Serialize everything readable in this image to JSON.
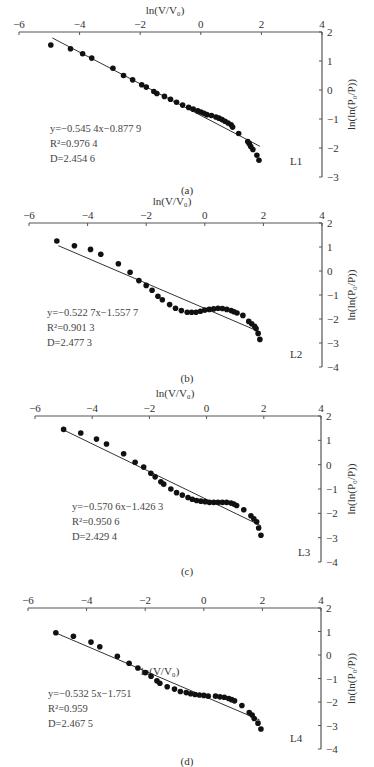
{
  "chart_data": [
    {
      "type": "scatter",
      "panel": "(a)",
      "series_label": "L1",
      "xlabel": "ln(V/V0)",
      "ylabel": "ln(ln(P0/P))",
      "xlim": [
        -6,
        4
      ],
      "ylim": [
        -3,
        2
      ],
      "xticks": [
        -6,
        -4,
        -2,
        0,
        2,
        4
      ],
      "yticks": [
        2,
        1,
        0,
        -1,
        -2,
        -3
      ],
      "fit": {
        "slope": -0.5454,
        "intercept": -0.8779,
        "x_range": [
          -4.9,
          1.95
        ]
      },
      "annotations": [
        "y=−0.545 4x−0.877 9",
        "R²=0.976 4",
        "D=2.454 6"
      ],
      "points": [
        [
          -4.95,
          1.55
        ],
        [
          -4.3,
          1.42
        ],
        [
          -3.9,
          1.25
        ],
        [
          -3.6,
          1.1
        ],
        [
          -2.9,
          0.75
        ],
        [
          -2.55,
          0.5
        ],
        [
          -2.25,
          0.35
        ],
        [
          -1.95,
          0.18
        ],
        [
          -1.8,
          0.1
        ],
        [
          -1.55,
          -0.05
        ],
        [
          -1.45,
          -0.12
        ],
        [
          -1.2,
          -0.22
        ],
        [
          -1.0,
          -0.32
        ],
        [
          -0.8,
          -0.42
        ],
        [
          -0.6,
          -0.52
        ],
        [
          -0.4,
          -0.6
        ],
        [
          -0.25,
          -0.66
        ],
        [
          -0.1,
          -0.72
        ],
        [
          0.0,
          -0.76
        ],
        [
          0.1,
          -0.8
        ],
        [
          0.2,
          -0.85
        ],
        [
          0.35,
          -0.88
        ],
        [
          0.5,
          -0.93
        ],
        [
          0.6,
          -0.97
        ],
        [
          0.7,
          -1.02
        ],
        [
          0.8,
          -1.08
        ],
        [
          0.9,
          -1.14
        ],
        [
          1.0,
          -1.2
        ],
        [
          1.05,
          -1.28
        ],
        [
          1.25,
          -1.5
        ],
        [
          1.55,
          -1.78
        ],
        [
          1.6,
          -1.85
        ],
        [
          1.65,
          -1.95
        ],
        [
          1.72,
          -2.05
        ],
        [
          1.85,
          -2.25
        ],
        [
          1.92,
          -2.42
        ]
      ]
    },
    {
      "type": "scatter",
      "panel": "(b)",
      "series_label": "L2",
      "xlabel": "ln(V/V0)",
      "ylabel": "ln(ln(P0/P))",
      "xlim": [
        -6,
        4
      ],
      "ylim": [
        -4,
        2
      ],
      "xticks": [
        -6,
        -4,
        -2,
        0,
        2,
        4
      ],
      "yticks": [
        2,
        1,
        0,
        -1,
        -2,
        -3,
        -4
      ],
      "fit": {
        "slope": -0.5227,
        "intercept": -1.5577,
        "x_range": [
          -5.0,
          1.75
        ]
      },
      "annotations": [
        "y=−0.522 7x−1.557 7",
        "R²=0.901 3",
        "D=2.477 3"
      ],
      "points": [
        [
          -5.05,
          1.25
        ],
        [
          -4.45,
          1.05
        ],
        [
          -3.9,
          0.9
        ],
        [
          -3.55,
          0.7
        ],
        [
          -2.95,
          0.3
        ],
        [
          -2.55,
          -0.05
        ],
        [
          -2.25,
          -0.4
        ],
        [
          -2.0,
          -0.6
        ],
        [
          -1.8,
          -0.8
        ],
        [
          -1.6,
          -1.05
        ],
        [
          -1.45,
          -1.2
        ],
        [
          -1.2,
          -1.4
        ],
        [
          -1.0,
          -1.55
        ],
        [
          -0.8,
          -1.65
        ],
        [
          -0.6,
          -1.72
        ],
        [
          -0.45,
          -1.72
        ],
        [
          -0.3,
          -1.72
        ],
        [
          -0.15,
          -1.68
        ],
        [
          0.0,
          -1.63
        ],
        [
          0.15,
          -1.6
        ],
        [
          0.3,
          -1.58
        ],
        [
          0.45,
          -1.55
        ],
        [
          0.6,
          -1.56
        ],
        [
          0.75,
          -1.6
        ],
        [
          0.9,
          -1.65
        ],
        [
          1.0,
          -1.7
        ],
        [
          1.1,
          -1.75
        ],
        [
          1.3,
          -1.85
        ],
        [
          1.5,
          -2.1
        ],
        [
          1.6,
          -2.2
        ],
        [
          1.7,
          -2.3
        ],
        [
          1.75,
          -2.4
        ],
        [
          1.82,
          -2.6
        ],
        [
          1.88,
          -2.85
        ]
      ]
    },
    {
      "type": "scatter",
      "panel": "(c)",
      "series_label": "L3",
      "xlabel": "ln(V/V0)",
      "ylabel": "ln(ln(P0/P))",
      "xlim": [
        -6,
        4
      ],
      "ylim": [
        -4,
        2
      ],
      "xticks": [
        -6,
        -4,
        -2,
        0,
        2,
        4
      ],
      "yticks": [
        2,
        1,
        0,
        -1,
        -2,
        -3,
        -4
      ],
      "fit": {
        "slope": -0.5706,
        "intercept": -1.4263,
        "x_range": [
          -4.95,
          1.9
        ]
      },
      "annotations": [
        "y=−0.570 6x−1.426 3",
        "R²=0.950 6",
        "D=2.429 4"
      ],
      "points": [
        [
          -5.0,
          1.45
        ],
        [
          -4.4,
          1.3
        ],
        [
          -3.85,
          1.05
        ],
        [
          -3.5,
          0.85
        ],
        [
          -2.9,
          0.45
        ],
        [
          -2.5,
          0.1
        ],
        [
          -2.2,
          -0.1
        ],
        [
          -1.95,
          -0.35
        ],
        [
          -1.8,
          -0.5
        ],
        [
          -1.6,
          -0.7
        ],
        [
          -1.5,
          -0.8
        ],
        [
          -1.25,
          -1.0
        ],
        [
          -1.05,
          -1.15
        ],
        [
          -0.85,
          -1.25
        ],
        [
          -0.65,
          -1.35
        ],
        [
          -0.5,
          -1.42
        ],
        [
          -0.35,
          -1.47
        ],
        [
          -0.2,
          -1.5
        ],
        [
          -0.05,
          -1.52
        ],
        [
          0.1,
          -1.55
        ],
        [
          0.25,
          -1.55
        ],
        [
          0.4,
          -1.55
        ],
        [
          0.55,
          -1.55
        ],
        [
          0.7,
          -1.55
        ],
        [
          0.85,
          -1.58
        ],
        [
          0.95,
          -1.62
        ],
        [
          1.05,
          -1.68
        ],
        [
          1.3,
          -1.85
        ],
        [
          1.55,
          -2.1
        ],
        [
          1.65,
          -2.22
        ],
        [
          1.75,
          -2.35
        ],
        [
          1.82,
          -2.6
        ],
        [
          1.9,
          -2.9
        ]
      ]
    },
    {
      "type": "scatter",
      "panel": "(d)",
      "series_label": "L4",
      "xlabel": "ln(V/V0)",
      "ylabel": "ln(ln(P0/P))",
      "xlim": [
        -6,
        4
      ],
      "ylim": [
        -4,
        2
      ],
      "xticks": [
        -6,
        -4,
        -2,
        0,
        2,
        4
      ],
      "yticks": [
        2,
        1,
        0,
        -1,
        -2,
        -3,
        -4
      ],
      "fit": {
        "slope": -0.5325,
        "intercept": -1.751,
        "x_range": [
          -5.0,
          1.9
        ]
      },
      "annotations": [
        "y=−0.532 5x−1.751",
        "R²=0.959",
        "D=2.467 5"
      ],
      "points": [
        [
          -5.05,
          0.95
        ],
        [
          -4.45,
          0.8
        ],
        [
          -3.85,
          0.55
        ],
        [
          -3.55,
          0.35
        ],
        [
          -2.95,
          -0.05
        ],
        [
          -2.55,
          -0.35
        ],
        [
          -2.25,
          -0.55
        ],
        [
          -2.0,
          -0.75
        ],
        [
          -1.8,
          -0.9
        ],
        [
          -1.6,
          -1.1
        ],
        [
          -1.5,
          -1.2
        ],
        [
          -1.25,
          -1.35
        ],
        [
          -1.0,
          -1.45
        ],
        [
          -0.8,
          -1.55
        ],
        [
          -0.6,
          -1.6
        ],
        [
          -0.45,
          -1.65
        ],
        [
          -0.3,
          -1.68
        ],
        [
          -0.15,
          -1.7
        ],
        [
          0.0,
          -1.72
        ],
        [
          0.15,
          -1.75
        ],
        [
          0.4,
          -1.75
        ],
        [
          0.55,
          -1.78
        ],
        [
          0.7,
          -1.8
        ],
        [
          0.85,
          -1.85
        ],
        [
          0.95,
          -1.9
        ],
        [
          1.05,
          -1.95
        ],
        [
          1.3,
          -2.15
        ],
        [
          1.55,
          -2.45
        ],
        [
          1.65,
          -2.55
        ],
        [
          1.72,
          -2.7
        ],
        [
          1.85,
          -2.9
        ],
        [
          1.95,
          -3.15
        ]
      ]
    }
  ],
  "panels": [
    {
      "label": "(a)",
      "series_label": "L1",
      "xlabel_text": "ln(V/V₀)",
      "ylabel_text": "ln(ln(P₀/P))"
    },
    {
      "label": "(b)",
      "series_label": "L2",
      "xlabel_text": "ln(V/V₀)",
      "ylabel_text": "ln(ln(P₀/P))"
    },
    {
      "label": "(c)",
      "series_label": "L3",
      "xlabel_text": "ln(V/V₀)",
      "ylabel_text": "ln(ln(P₀/P))"
    },
    {
      "label": "(d)",
      "series_label": "L4",
      "xlabel_text": "ln(V/V₀)",
      "ylabel_text": "ln(ln(P₀/P))"
    }
  ]
}
